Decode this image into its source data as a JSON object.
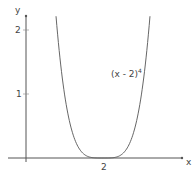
{
  "chart_data": {
    "type": "line",
    "title": "",
    "xlabel": "x",
    "ylabel": "y",
    "xticks": [
      "2"
    ],
    "yticks": [
      "1",
      "2"
    ],
    "xlim": [
      -0.1,
      3.9
    ],
    "ylim": [
      0,
      2.2
    ],
    "grid": false,
    "series": [
      {
        "name": "(x - 2)^4",
        "label_base": "(x - 2)",
        "label_exp": "4",
        "x": [
          0.78,
          1.0,
          1.2,
          1.4,
          1.6,
          1.8,
          2.0,
          2.2,
          2.4,
          2.6,
          2.8,
          3.0,
          3.22
        ],
        "y": [
          2.2,
          1.0,
          0.41,
          0.13,
          0.026,
          0.0016,
          0,
          0.0016,
          0.026,
          0.13,
          0.41,
          1.0,
          2.2
        ]
      }
    ]
  }
}
